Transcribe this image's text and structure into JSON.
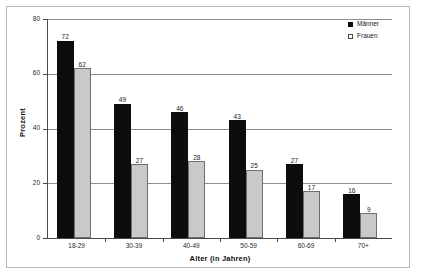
{
  "chart_data": {
    "type": "bar",
    "title": "",
    "xlabel": "Alter (in Jahren)",
    "ylabel": "Prozent",
    "categories": [
      "18-29",
      "30-39",
      "40-49",
      "50-59",
      "60-69",
      "70+"
    ],
    "series": [
      {
        "name": "Männer",
        "color": "#0d0d0d",
        "values": [
          72,
          49,
          46,
          43,
          27,
          16
        ]
      },
      {
        "name": "Frauen",
        "color": "#c9c9c9",
        "values": [
          62,
          27,
          28,
          25,
          17,
          9
        ]
      }
    ],
    "ylim": [
      0,
      80
    ],
    "yticks": [
      0,
      20,
      40,
      60,
      80
    ],
    "ytick_labels": [
      "0",
      "20",
      "40",
      "60",
      "80"
    ],
    "grid": true,
    "grid_axis": "y",
    "legend_position": "top-right",
    "data_labels": true
  },
  "legend": {
    "items": [
      {
        "label": "Männer",
        "swatch": "filled-square-icon"
      },
      {
        "label": "Frauen",
        "swatch": "open-square-icon"
      }
    ]
  },
  "colors": {
    "maenner": "#0d0d0d",
    "frauen": "#c9c9c9",
    "frauen_border": "#6f6f6f",
    "gridline": "#8c8c8c",
    "axis": "#4a4a4a",
    "frame": "#b9b9b9",
    "text": "#1a1a1a",
    "background": "#ffffff"
  }
}
